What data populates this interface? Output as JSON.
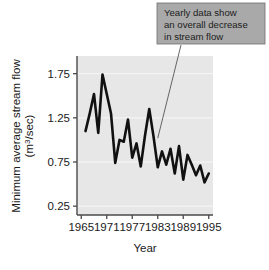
{
  "chart_data": {
    "type": "line",
    "title": "",
    "xlabel": "Year",
    "ylabel": "Minimum average stream flow (m3/sec)",
    "ylabel_line1": "Minimum average stream flow",
    "ylabel_line2_prefix": "(m",
    "ylabel_line2_sup": "3",
    "ylabel_line2_suffix": "/sec)",
    "xlim": [
      1964,
      1996
    ],
    "ylim": [
      0.15,
      1.95
    ],
    "xticks": [
      1965,
      1971,
      1977,
      1983,
      1989,
      1995
    ],
    "xtick_labels": [
      "1965",
      "1971",
      "1977",
      "1983",
      "1989",
      "1995"
    ],
    "yticks": [
      0.25,
      0.75,
      1.25,
      1.75
    ],
    "ytick_labels": [
      "0.25",
      "0.75",
      "1.25",
      "1.75"
    ],
    "grid": true,
    "grid_color": "#f7f7f7",
    "plot_background": "#e7e7e7",
    "line_color": "#111111",
    "line_width": 2.6,
    "legend": "none",
    "x": [
      1966,
      1967,
      1968,
      1969,
      1970,
      1971,
      1972,
      1973,
      1974,
      1975,
      1976,
      1977,
      1978,
      1979,
      1980,
      1981,
      1982,
      1983,
      1984,
      1985,
      1986,
      1987,
      1988,
      1989,
      1990,
      1991,
      1992,
      1993,
      1994,
      1995
    ],
    "values": [
      1.1,
      1.3,
      1.52,
      1.08,
      1.74,
      1.52,
      1.3,
      0.74,
      1.0,
      0.98,
      1.23,
      0.8,
      0.96,
      0.7,
      1.05,
      1.35,
      1.04,
      0.69,
      0.87,
      0.72,
      0.9,
      0.62,
      0.93,
      0.55,
      0.83,
      0.72,
      0.6,
      0.71,
      0.52,
      0.62
    ],
    "annotations": [
      {
        "name": "trend-callout",
        "lines": [
          "Yearly data show",
          "an overall decrease",
          "in stream flow"
        ],
        "box_color": "#a9a9a9",
        "border_color": "#6e6e6e",
        "leader_target_year": 1983,
        "leader_target_value": 1.02
      }
    ]
  },
  "axes": {
    "x_title": "Year",
    "y_title_line1": "Minimum average stream flow",
    "y_title_line2": "(m3/sec)"
  }
}
